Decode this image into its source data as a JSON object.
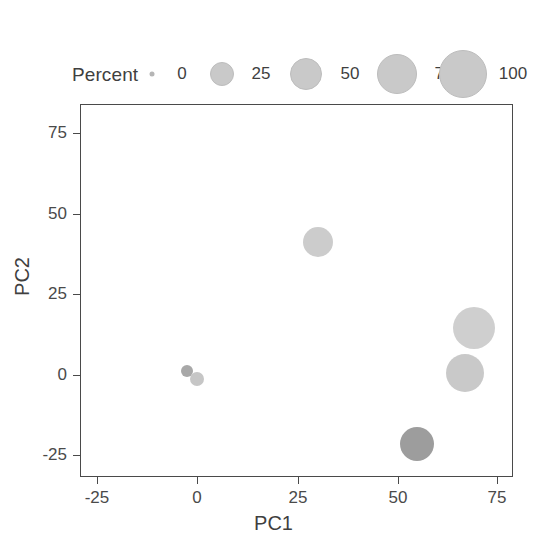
{
  "chart_data": {
    "type": "scatter",
    "title": "",
    "xlabel": "PC1",
    "ylabel": "PC2",
    "xlim": [
      -33,
      79
    ],
    "ylim": [
      -31,
      85
    ],
    "xticks": [
      -25,
      0,
      25,
      50,
      75
    ],
    "xtick_labels": [
      "-25",
      "0",
      "25",
      "50",
      "75"
    ],
    "yticks": [
      -25,
      0,
      25,
      50,
      75
    ],
    "ytick_labels": [
      "-25",
      "0",
      "25",
      "50",
      "75"
    ],
    "grid": false,
    "size_encoding": "Percent",
    "points": [
      {
        "label": "p1",
        "x": -2.7,
        "y": 1.6,
        "percent": 4,
        "radius_px": 6,
        "color": "#a8a8a8"
      },
      {
        "label": "p2",
        "x": -0.2,
        "y": -0.9,
        "percent": 6,
        "radius_px": 7,
        "color": "#c6c6c6"
      },
      {
        "label": "p3",
        "x": 29.8,
        "y": 41.5,
        "percent": 45,
        "radius_px": 15,
        "color": "#cccccc"
      },
      {
        "label": "p4",
        "x": 68.2,
        "y": 14.9,
        "percent": 88,
        "radius_px": 21,
        "color": "#cfcfcf"
      },
      {
        "label": "p5",
        "x": 66.0,
        "y": 0.9,
        "percent": 70,
        "radius_px": 19,
        "color": "#c9c9c9"
      },
      {
        "label": "p6",
        "x": 54.3,
        "y": -21.0,
        "percent": 55,
        "radius_px": 17,
        "color": "#9d9d9d"
      }
    ]
  },
  "legend": {
    "title": "Percent",
    "entries": [
      {
        "label": "0",
        "radius_px": 2.5,
        "center_x": 152,
        "label_x": 182
      },
      {
        "label": "25",
        "radius_px": 11,
        "center_x": 222,
        "label_x": 261
      },
      {
        "label": "50",
        "radius_px": 15,
        "center_x": 306,
        "label_x": 350
      },
      {
        "label": "75",
        "radius_px": 19,
        "center_x": 397,
        "label_x": 444
      },
      {
        "label": "100",
        "radius_px": 23,
        "center_x": 463,
        "label_x": 513
      }
    ],
    "key_color": "#c9c9c9"
  },
  "axes": {
    "x_label": "PC1",
    "y_label": "PC2",
    "x_ticks": [
      {
        "label": "-25",
        "px": 97
      },
      {
        "label": "0",
        "px": 197
      },
      {
        "label": "25",
        "px": 298
      },
      {
        "label": "50",
        "px": 398
      },
      {
        "label": "75",
        "px": 497
      }
    ],
    "y_ticks": [
      {
        "label": "75",
        "px": 133
      },
      {
        "label": "50",
        "px": 214
      },
      {
        "label": "25",
        "px": 294
      },
      {
        "label": "0",
        "px": 375
      },
      {
        "label": "-25",
        "px": 455
      }
    ],
    "panel_color": "#4a4a4a"
  },
  "colors": {
    "background": "#ffffff",
    "text": "#3f3f3f",
    "axis": "#4a4a4a",
    "bubble_default": "#c9c9c9"
  }
}
